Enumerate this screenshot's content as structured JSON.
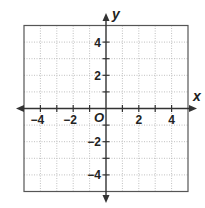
{
  "chart_data": {
    "type": "coordinate-plane",
    "title": "",
    "xlabel": "x",
    "ylabel": "y",
    "origin_label": "O",
    "xlim": [
      -5,
      5
    ],
    "ylim": [
      -5,
      5
    ],
    "grid": true,
    "grid_step": 1,
    "x_tick_labels": [
      {
        "value": -4,
        "label": "−4"
      },
      {
        "value": -2,
        "label": "−2"
      },
      {
        "value": 2,
        "label": "2"
      },
      {
        "value": 4,
        "label": "4"
      }
    ],
    "y_tick_labels": [
      {
        "value": 4,
        "label": "4"
      },
      {
        "value": 2,
        "label": "2"
      },
      {
        "value": -2,
        "label": "−2"
      },
      {
        "value": -4,
        "label": "−4"
      }
    ],
    "series": []
  },
  "colors": {
    "axis": "#333333",
    "border": "#555555",
    "grid": "#b0b0b0",
    "text": "#222222"
  }
}
